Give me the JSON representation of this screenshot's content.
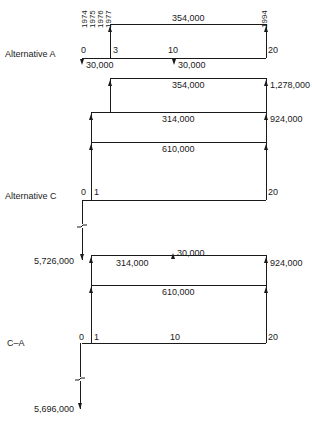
{
  "figure": {
    "type": "cash-flow-diagram",
    "years": {
      "start_labels": [
        "1974",
        "1975",
        "1976",
        "1977"
      ],
      "end_label": "1994"
    },
    "alternative_a": {
      "label": "Alternative A",
      "periods": {
        "p0": "0",
        "p3": "3",
        "p10": "10",
        "p20": "20"
      },
      "annual_benefit": "354,000",
      "outflow_year0": "30,000",
      "outflow_year10": "30,000"
    },
    "alternative_c": {
      "label": "Alternative C",
      "periods": {
        "p0": "0",
        "p1": "1",
        "p20": "20"
      },
      "benefit_top": "354,000",
      "benefit_mid": "314,000",
      "benefit_base": "610,000",
      "total_top": "1,278,000",
      "total_mid": "924,000",
      "initial_cost": "5,726,000"
    },
    "c_minus_a": {
      "label": "C–A",
      "periods": {
        "p0": "0",
        "p1": "1",
        "p10": "10",
        "p20": "20"
      },
      "saved_outflow": "30,000",
      "benefit_mid": "314,000",
      "benefit_base": "610,000",
      "total": "924,000",
      "initial_cost": "5,696,000"
    }
  }
}
